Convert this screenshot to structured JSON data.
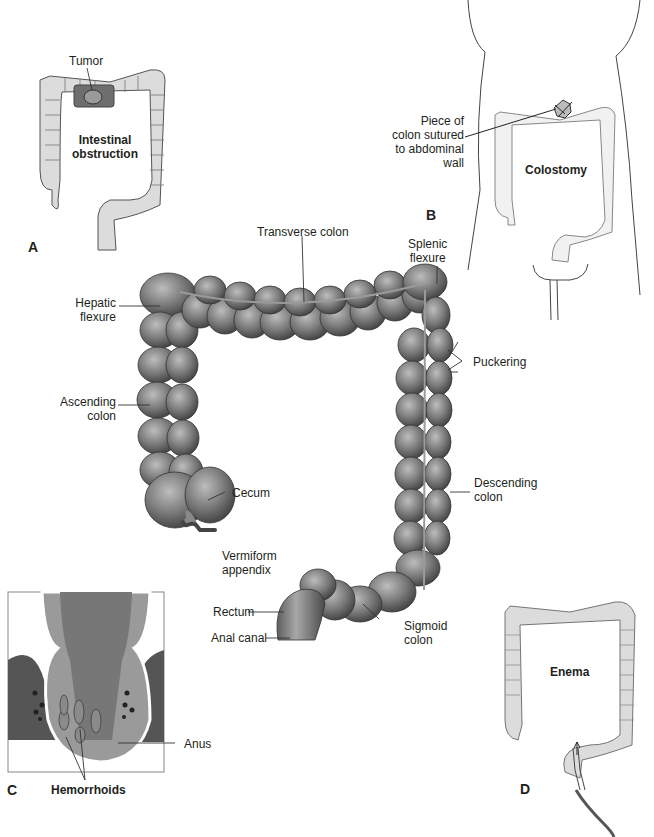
{
  "panels": {
    "A": {
      "letter": "A",
      "title": "Intestinal\nobstruction",
      "labels": {
        "tumor": "Tumor"
      }
    },
    "B": {
      "letter": "B",
      "title": "Colostomy",
      "labels": {
        "stoma": "Piece of\ncolon sutured\nto abdominal\nwall"
      }
    },
    "C": {
      "letter": "C",
      "title": "Hemorrhoids",
      "labels": {
        "anus": "Anus"
      }
    },
    "D": {
      "letter": "D",
      "title": "Enema"
    }
  },
  "main": {
    "labels": {
      "hepatic_flexure": "Hepatic\nflexure",
      "transverse_colon": "Transverse colon",
      "splenic_flexure": "Splenic\nflexure",
      "ascending_colon": "Ascending\ncolon",
      "puckering": "Puckering",
      "descending_colon": "Descending\ncolon",
      "cecum": "Cecum",
      "vermiform_appendix": "Vermiform\nappendix",
      "rectum": "Rectum",
      "anal_canal": "Anal canal",
      "sigmoid_colon": "Sigmoid\ncolon"
    }
  },
  "colors": {
    "colon_light": "#d9d9d9",
    "colon_dark": "#6d6d6d",
    "tumor": "#7a7a7a",
    "text": "#231f20"
  }
}
